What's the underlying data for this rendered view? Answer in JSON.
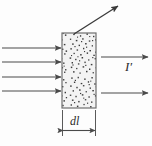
{
  "figure": {
    "name": "radiation-absorption-slab-diagram",
    "background_color": "#fdfdfd",
    "stroke_color": "#4a4a4a",
    "slab": {
      "name": "absorbing-medium-slab",
      "fill_color": "#f2f2f2",
      "border_color": "#6e6e6e",
      "texture": "stippled-dots",
      "dot_color": "#3d3d3d",
      "x": 62,
      "y": 33,
      "width": 34,
      "height": 75
    },
    "incoming_rays": {
      "name": "incident-beam-arrows",
      "count": 4,
      "y_positions": [
        48,
        62,
        77,
        91
      ],
      "x_start": 2,
      "x_end": 61,
      "direction": "right"
    },
    "outgoing_rays": {
      "name": "transmitted-beam-arrows",
      "count": 2,
      "y_positions": [
        57,
        93
      ],
      "x_start": 100,
      "x_end": 147,
      "direction": "right"
    },
    "scattered_ray": {
      "name": "scattered-beam-arrow",
      "x1": 74,
      "y1": 34,
      "x2": 119,
      "y2": 5,
      "direction": "up-right"
    },
    "dimension": {
      "name": "thickness-dimension",
      "label": "dl",
      "label_d": "d",
      "label_l": "l",
      "extension_top": 110,
      "extension_bottom": 134,
      "arrow_y": 130,
      "x_left": 62,
      "x_right": 96
    },
    "labels": {
      "transmitted_intensity": "I",
      "transmitted_intensity_prime": "′",
      "transmitted_intensity_full": "I′"
    }
  }
}
